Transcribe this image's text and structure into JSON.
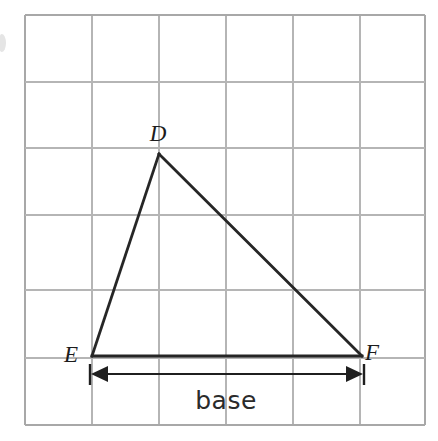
{
  "figure": {
    "background_color": "#ffffff",
    "width": 438,
    "height": 441
  },
  "grid": {
    "line_color": "#b5b5b5",
    "cell_size": 67,
    "x_lines": [
      25,
      92,
      159,
      226,
      293,
      360,
      425
    ],
    "y_lines": [
      15,
      82,
      148,
      215,
      290,
      358,
      425
    ],
    "left": 25,
    "top": 15,
    "right": 425,
    "bottom": 425
  },
  "triangle": {
    "name": "triangle-DEF",
    "stroke_color": "#262626",
    "vertices": [
      {
        "id": "D",
        "label": "D",
        "x": 159,
        "y": 154,
        "label_x": 158,
        "label_y": 141
      },
      {
        "id": "E",
        "label": "E",
        "x": 92,
        "y": 356,
        "label_x": 71,
        "label_y": 362
      },
      {
        "id": "F",
        "label": "F",
        "x": 362,
        "y": 356,
        "label_x": 372,
        "label_y": 360
      }
    ],
    "edges": [
      {
        "id": "ED",
        "from": "E",
        "to": "D"
      },
      {
        "id": "DF",
        "from": "D",
        "to": "F"
      },
      {
        "id": "EF",
        "from": "E",
        "to": "F"
      }
    ]
  },
  "dimension": {
    "name": "base-dimension",
    "label": "base",
    "label_x": 226,
    "label_y": 409,
    "line_y": 374,
    "x_start": 93,
    "x_end": 362,
    "arrow_color": "#1f1f1f",
    "double_headed": true
  }
}
